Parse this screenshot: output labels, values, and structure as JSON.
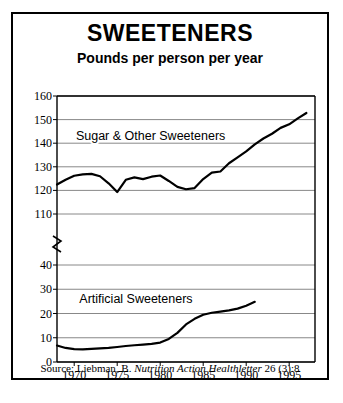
{
  "figure": {
    "title": "SWEETENERS",
    "subtitle": "Pounds per person per year",
    "source_prefix": "Source: Liebman, B. ",
    "source_italic": "Nutrition Action Healthletter",
    "source_suffix": " 26 (3):8"
  },
  "chart_data": {
    "type": "line",
    "title": "SWEETENERS",
    "subtitle": "Pounds per person per year",
    "xlabel": "",
    "ylabel": "Pounds per person per year",
    "grid": true,
    "legend": "inline-labels",
    "axis_break": {
      "between": [
        110,
        40
      ],
      "note": "y-axis broken between 110 and 40"
    },
    "xlim": [
      1968,
      1998
    ],
    "xticks": [
      1970,
      1975,
      1980,
      1985,
      1990,
      1995
    ],
    "yticks_upper": [
      110,
      120,
      130,
      140,
      150,
      160
    ],
    "yticks_lower": [
      0,
      10,
      20,
      30,
      40
    ],
    "series": [
      {
        "name": "Sugar & Other Sweeteners",
        "label_x": 1970.2,
        "label_y": 143,
        "x": [
          1968,
          1969,
          1970,
          1971,
          1972,
          1973,
          1974,
          1975,
          1976,
          1977,
          1978,
          1979,
          1980,
          1981,
          1982,
          1983,
          1984,
          1985,
          1986,
          1987,
          1988,
          1989,
          1990,
          1991,
          1992,
          1993,
          1994,
          1995,
          1996,
          1997
        ],
        "values": [
          122.5,
          124.5,
          126.2,
          126.8,
          127.0,
          126.0,
          123.0,
          119.3,
          124.5,
          125.5,
          124.8,
          125.8,
          126.3,
          124.0,
          121.5,
          120.5,
          121.0,
          124.8,
          127.5,
          128.0,
          131.5,
          134.0,
          136.5,
          139.5,
          142.0,
          144.0,
          146.5,
          148.0,
          150.5,
          152.8
        ]
      },
      {
        "name": "Artificial Sweeteners",
        "label_x": 1970.6,
        "label_y": 26,
        "x": [
          1968,
          1969,
          1970,
          1971,
          1972,
          1973,
          1974,
          1975,
          1976,
          1977,
          1978,
          1979,
          1980,
          1981,
          1982,
          1983,
          1984,
          1985,
          1986,
          1987,
          1988,
          1989,
          1990,
          1991
        ],
        "values": [
          6.8,
          5.8,
          5.3,
          5.2,
          5.4,
          5.6,
          5.8,
          6.2,
          6.6,
          6.9,
          7.2,
          7.5,
          8.0,
          9.5,
          12.0,
          15.5,
          17.8,
          19.5,
          20.3,
          20.8,
          21.3,
          22.0,
          23.2,
          24.8
        ]
      }
    ]
  }
}
